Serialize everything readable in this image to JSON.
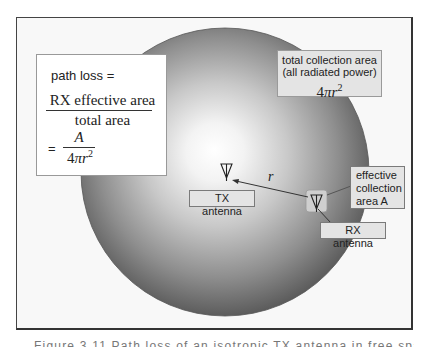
{
  "figure": {
    "path_loss_box": {
      "title": "path loss =",
      "numerator": "RX effective area",
      "denominator": "total area",
      "equals": "=",
      "small_numerator": "A",
      "small_denominator_prefix": "4",
      "small_denominator_pi": "π",
      "small_denominator_r": "r",
      "small_denominator_exp": "2"
    },
    "total_area_box": {
      "line1": "total collection area",
      "line2": "(all radiated power)",
      "formula_prefix": "4",
      "formula_pi": "π",
      "formula_r": "r",
      "formula_exp": "2"
    },
    "tx_label": "TX antenna",
    "rx_label": "RX antenna",
    "effective_area_label": {
      "line1": "effective",
      "line2": "collection",
      "line3": "area A"
    },
    "distance_label": "r",
    "caption": "Figure 3.11  Path loss of an isotropic TX antenna in free space"
  },
  "colors": {
    "sphere_center": "#ffffff",
    "sphere_edge": "#575757",
    "label_fill": "#e4e4e4",
    "line": "#333333"
  },
  "icons": {
    "tx_antenna": "antenna-icon",
    "rx_antenna": "antenna-icon"
  }
}
